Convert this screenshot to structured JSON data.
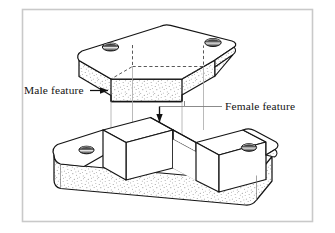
{
  "figure": {
    "frame": {
      "border_color": "#c9c9c9",
      "background_color": "#ffffff"
    },
    "labels": [
      {
        "id": "male",
        "text": "Male feature",
        "leader": "horizontal-line-with-right-arrowhead",
        "points_to": "downward tongue on underside of upper plate"
      },
      {
        "id": "female",
        "text": "Female feature",
        "leader": "horizontal-line-turning-down-with-arrowhead",
        "points_to": "central groove channel of lower block"
      }
    ],
    "parts": [
      {
        "id": "upper-plate",
        "name": "Upper plate with male tongue",
        "position": "top",
        "holes": 2,
        "feature": "male",
        "shading": "stipple"
      },
      {
        "id": "lower-block",
        "name": "Lower block with female groove",
        "position": "bottom",
        "holes": 2,
        "feature": "female",
        "shading": "stipple"
      }
    ],
    "alignment_lines": {
      "style": "thin gray vertical projection lines",
      "color": "#a8a8a8",
      "count": 4,
      "description": "project mating tongue edges down onto groove edges"
    },
    "colors": {
      "outline": "#1a1a1a",
      "stipple": "#3a3a3a",
      "face_light": "#ffffff",
      "projection": "#a8a8a8",
      "hole_fill": "#2b2b2b"
    }
  }
}
